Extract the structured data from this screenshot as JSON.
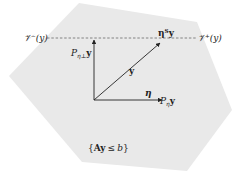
{
  "diagram": {
    "region": {
      "label": "{Ay ≤ b}",
      "fill": "#e9e9e9",
      "vertices": [
        [
          79,
          3
        ],
        [
          197,
          22
        ],
        [
          232,
          110
        ],
        [
          187,
          171
        ],
        [
          82,
          162
        ],
        [
          9,
          76
        ]
      ]
    },
    "dashed_line": {
      "y": 38,
      "x_start": 47,
      "x_end": 197,
      "left_label": "𝒱⁻(y)",
      "right_label": "𝒱⁺(y)",
      "color": "#777777"
    },
    "origin": [
      94,
      100
    ],
    "vectors": [
      {
        "name": "y",
        "label": "y",
        "end": [
          161,
          42
        ]
      },
      {
        "name": "P_eta_perp_y",
        "label": "P",
        "sub": "η⊥",
        "suffix": "y",
        "end": [
          94,
          38
        ]
      },
      {
        "name": "P_eta_y",
        "label": "P",
        "sub": "η",
        "suffix": "y",
        "end": [
          164,
          100
        ]
      }
    ],
    "labels": {
      "eta": "η",
      "eta_T_y": "ηᵀy",
      "region": "{Ay ≤ b}",
      "v_minus": "𝒱⁻(y)",
      "v_plus": "𝒱⁺(y)",
      "y": "y",
      "p_perp_main": "P",
      "p_perp_sub": "η⊥",
      "p_perp_y": "y",
      "p_eta_main": "P",
      "p_eta_sub": "η",
      "p_eta_y": "y",
      "region_set_open": "{",
      "region_A": "A",
      "region_y": "y",
      "region_leq": "≤",
      "region_b": "b",
      "region_set_close": "}"
    }
  }
}
